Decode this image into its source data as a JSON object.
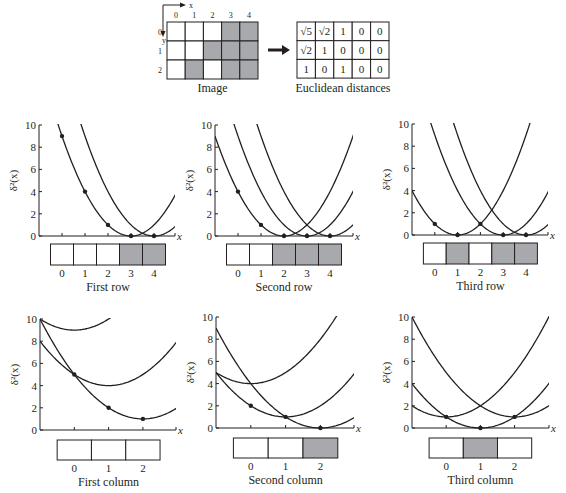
{
  "figure": {
    "image_grid": {
      "caption": "Image",
      "axis_x_label": "x",
      "axis_y_label": "y",
      "col_labels": [
        "0",
        "1",
        "2",
        "3",
        "4"
      ],
      "row_labels": [
        "0",
        "1",
        "2"
      ],
      "cells": [
        [
          0,
          0,
          0,
          1,
          1
        ],
        [
          0,
          0,
          1,
          1,
          1
        ],
        [
          0,
          1,
          0,
          1,
          1
        ]
      ],
      "fill_color": "#a7a9ac"
    },
    "distance_table": {
      "caption": "Euclidean distances",
      "cells": [
        [
          "√5",
          "√2",
          "1",
          "0",
          "0"
        ],
        [
          "√2",
          "1",
          "0",
          "0",
          "0"
        ],
        [
          "1",
          "0",
          "1",
          "0",
          "0"
        ]
      ]
    },
    "ylabel": "δ²(x)",
    "xlabel": "x",
    "yticks": [
      "0",
      "2",
      "4",
      "6",
      "8",
      "10"
    ]
  },
  "chart_data": [
    {
      "type": "line",
      "title": "First row",
      "xlabel": "x",
      "ylabel": "δ²(x)",
      "ylim": [
        0,
        10
      ],
      "xlim": [
        -1,
        5
      ],
      "strip": [
        0,
        0,
        0,
        1,
        1
      ],
      "strip_labels": [
        "0",
        "1",
        "2",
        "3",
        "4"
      ],
      "parabolas": [
        {
          "center": 3,
          "offset": 0
        },
        {
          "center": 4,
          "offset": 0
        }
      ],
      "points": [
        [
          0,
          9
        ],
        [
          1,
          4
        ],
        [
          2,
          1
        ],
        [
          3,
          0
        ],
        [
          4,
          0
        ]
      ]
    },
    {
      "type": "line",
      "title": "Second row",
      "xlabel": "x",
      "ylabel": "δ²(x)",
      "ylim": [
        0,
        10
      ],
      "xlim": [
        -1,
        5
      ],
      "strip": [
        0,
        0,
        1,
        1,
        1
      ],
      "strip_labels": [
        "0",
        "1",
        "2",
        "3",
        "4"
      ],
      "parabolas": [
        {
          "center": 2,
          "offset": 0
        },
        {
          "center": 3,
          "offset": 0
        },
        {
          "center": 4,
          "offset": 0
        }
      ],
      "points": [
        [
          0,
          4
        ],
        [
          1,
          1
        ],
        [
          2,
          0
        ],
        [
          3,
          0
        ],
        [
          4,
          0
        ]
      ]
    },
    {
      "type": "line",
      "title": "Third row",
      "xlabel": "x",
      "ylabel": "δ²(x)",
      "ylim": [
        0,
        10
      ],
      "xlim": [
        -1,
        5
      ],
      "strip": [
        0,
        1,
        0,
        1,
        1
      ],
      "strip_labels": [
        "0",
        "1",
        "2",
        "3",
        "4"
      ],
      "parabolas": [
        {
          "center": 1,
          "offset": 0
        },
        {
          "center": 3,
          "offset": 0
        },
        {
          "center": 4,
          "offset": 0
        }
      ],
      "points": [
        [
          0,
          1
        ],
        [
          1,
          0
        ],
        [
          2,
          1
        ],
        [
          3,
          0
        ],
        [
          4,
          0
        ]
      ]
    },
    {
      "type": "line",
      "title": "First column",
      "xlabel": "x",
      "ylabel": "δ²(x)",
      "ylim": [
        0,
        10
      ],
      "xlim": [
        -1,
        3
      ],
      "strip": [
        0,
        0,
        0
      ],
      "strip_labels": [
        "0",
        "1",
        "2"
      ],
      "parabolas": [
        {
          "center": 0,
          "offset": 9
        },
        {
          "center": 1,
          "offset": 4
        },
        {
          "center": 2,
          "offset": 1
        }
      ],
      "points": [
        [
          0,
          5
        ],
        [
          1,
          2
        ],
        [
          2,
          1
        ]
      ]
    },
    {
      "type": "line",
      "title": "Second column",
      "xlabel": "x",
      "ylabel": "δ²(x)",
      "ylim": [
        0,
        10
      ],
      "xlim": [
        -1,
        3
      ],
      "strip": [
        0,
        0,
        1
      ],
      "strip_labels": [
        "0",
        "1",
        "2"
      ],
      "parabolas": [
        {
          "center": 0,
          "offset": 4
        },
        {
          "center": 1,
          "offset": 1
        },
        {
          "center": 2,
          "offset": 0
        }
      ],
      "points": [
        [
          0,
          2
        ],
        [
          1,
          1
        ],
        [
          2,
          0
        ]
      ]
    },
    {
      "type": "line",
      "title": "Third column",
      "xlabel": "x",
      "ylabel": "δ²(x)",
      "ylim": [
        0,
        10
      ],
      "xlim": [
        -1,
        3
      ],
      "strip": [
        0,
        1,
        0
      ],
      "strip_labels": [
        "0",
        "1",
        "2"
      ],
      "parabolas": [
        {
          "center": 0,
          "offset": 1
        },
        {
          "center": 1,
          "offset": 0
        },
        {
          "center": 2,
          "offset": 1
        }
      ],
      "points": [
        [
          0,
          1
        ],
        [
          1,
          0
        ],
        [
          2,
          1
        ]
      ]
    }
  ]
}
